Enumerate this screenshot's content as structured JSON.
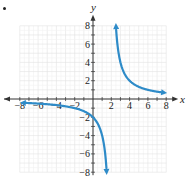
{
  "marker": "•",
  "chart_data": {
    "type": "line",
    "title": "",
    "xlabel": "x",
    "ylabel": "y",
    "xlim": [
      -8,
      8
    ],
    "ylim": [
      -8,
      8
    ],
    "grid": true,
    "minor_grid_step": 1,
    "x_ticks": [
      -8,
      -6,
      -4,
      -2,
      2,
      4,
      6,
      8
    ],
    "y_ticks": [
      -8,
      -6,
      -4,
      -2,
      2,
      4,
      6,
      8
    ],
    "x_tick_labels": [
      "-8",
      "-6",
      "-4",
      "-2",
      "2",
      "4",
      "6",
      "8"
    ],
    "y_tick_labels": [
      "-8",
      "-6",
      "-4",
      "-2",
      "2",
      "4",
      "6",
      "8"
    ],
    "function": "y = 4/(x - 2)",
    "asymptotes": {
      "vertical": 2,
      "horizontal": 0
    },
    "series": [
      {
        "name": "left branch",
        "color": "#2E8BC8",
        "x": [
          -8,
          -6,
          -4,
          -2,
          0,
          1,
          1.5
        ],
        "y": [
          -0.4,
          -0.5,
          -0.67,
          -1,
          -2,
          -4,
          -8
        ]
      },
      {
        "name": "right branch",
        "color": "#2E8BC8",
        "x": [
          2.5,
          3,
          4,
          6,
          8
        ],
        "y": [
          8,
          4,
          2,
          1,
          0.67
        ]
      }
    ],
    "colors": {
      "curve": "#2E8BC8",
      "grid": "#e2e2e2",
      "axis": "#333333",
      "text": "#222222"
    }
  }
}
